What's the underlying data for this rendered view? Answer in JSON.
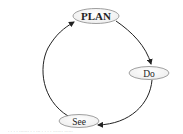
{
  "diagram": {
    "type": "cycle",
    "nodes": [
      {
        "id": "plan",
        "label": "PLAN"
      },
      {
        "id": "do",
        "label": "Do"
      },
      {
        "id": "see",
        "label": "See"
      }
    ],
    "edges": [
      {
        "from": "plan",
        "to": "do"
      },
      {
        "from": "do",
        "to": "see"
      },
      {
        "from": "see",
        "to": "plan"
      }
    ],
    "colors": {
      "stroke": "#222222",
      "node_border": "#888888",
      "background": "#ffffff"
    }
  },
  "caption": ". . . . ....... . . ... . . . . ....... ......"
}
